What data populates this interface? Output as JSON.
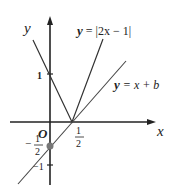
{
  "diagram": {
    "axes": {
      "x_label": "x",
      "y_label": "y",
      "origin_label": "O"
    },
    "ticks": {
      "y_one": "1",
      "y_neg_one": "−1",
      "x_half_num": "1",
      "x_half_den": "2",
      "y_neg_half_sign": "−",
      "y_neg_half_num": "1",
      "y_neg_half_den": "2"
    },
    "curves": [
      {
        "label_prefix": "y",
        "label_rest": " = |2x − 1|",
        "type": "absolute-value",
        "vertex": [
          0.5,
          0
        ]
      },
      {
        "label_prefix": "y",
        "label_rest": " = x + b",
        "type": "line",
        "intercept_point": [
          0,
          -0.5
        ]
      }
    ],
    "colors": {
      "line": "#333333",
      "point": "#777777"
    }
  }
}
